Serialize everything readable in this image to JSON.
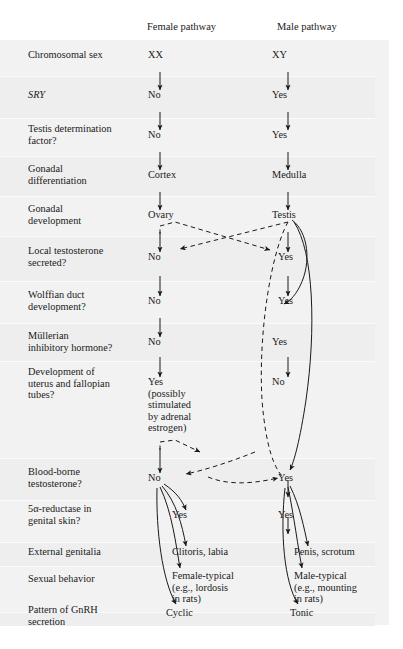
{
  "figure": {
    "type": "flowchart",
    "background": "#ffffff",
    "plate_color": "#f2f2f2",
    "ink_color": "#1a1a1a",
    "headers": {
      "female": "Female pathway",
      "male": "Male pathway"
    },
    "rows": [
      {
        "label": "Chromosomal sex",
        "female": "XX",
        "male": "XY"
      },
      {
        "label": "SRY",
        "italic": true,
        "female": "No",
        "male": "Yes"
      },
      {
        "label": "Testis determination\nfactor?",
        "female": "No",
        "male": "Yes"
      },
      {
        "label": "Gonadal\ndifferentiation",
        "female": "Cortex",
        "male": "Medulla"
      },
      {
        "label": "Gonadal\ndevelopment",
        "female": "Ovary",
        "male": "Testis"
      },
      {
        "label": "Local testosterone\nsecreted?",
        "female": "No",
        "male": "Yes"
      },
      {
        "label": "Wolffian duct\ndevelopment?",
        "female": "No",
        "male": "Yes"
      },
      {
        "label": "Müllerian\ninhibitory hormone?",
        "female": "No",
        "male": "Yes"
      },
      {
        "label": "Development of\nuterus and fallopian\ntubes?",
        "female": "Yes\n(possibly\nstimulated\nby adrenal\nestrogen)",
        "male": "No"
      },
      {
        "label": "Blood-borne\ntestosterone?",
        "female": "No",
        "male": "Yes"
      },
      {
        "label": "5α-reductase in\ngenital skin?",
        "female": "Yes",
        "male": "Yes"
      },
      {
        "label": "External genitalia",
        "female": "Clitoris, labia",
        "male": "Penis, scrotum"
      },
      {
        "label": "Sexual behavior",
        "female": "Female-typical\n(e.g., lordosis\nin rats)",
        "male": "Male-typical\n(e.g., mounting\nin rats)"
      },
      {
        "label": "Pattern of GnRH\nsecretion",
        "female": "Cyclic",
        "male": "Tonic"
      }
    ]
  }
}
